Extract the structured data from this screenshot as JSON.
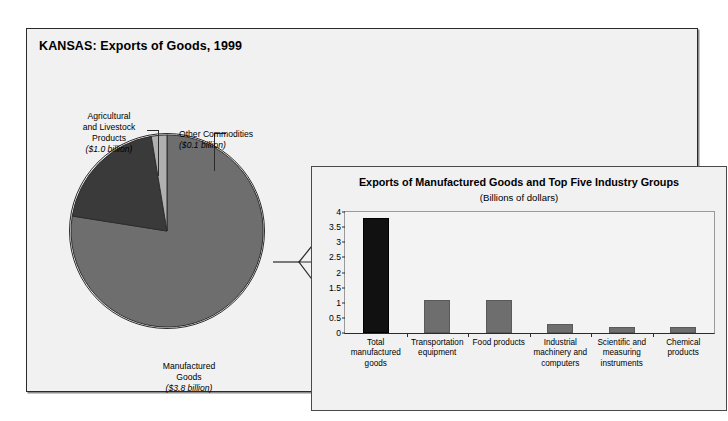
{
  "figure": {
    "title": "KANSAS: Exports of Goods, 1999"
  },
  "pie": {
    "slices": [
      {
        "name": "Manufactured Goods",
        "label_line1": "Manufactured",
        "label_line2": "Goods",
        "amount": "($3.8 billion)",
        "value": 3.8,
        "color": "#6e6e6e"
      },
      {
        "name": "Agricultural and Livestock Products",
        "label_line1": "Agricultural",
        "label_line2": "and Livestock",
        "label_line3": "Products",
        "amount": "($1.0 billion)",
        "value": 1.0,
        "color": "#3a3a3a"
      },
      {
        "name": "Other Commodities",
        "label_line1": "Other Commodities",
        "amount": "($0.1 billion)",
        "value": 0.1,
        "color": "#b0b0b0"
      }
    ]
  },
  "chart_data": {
    "type": "bar",
    "title": "Exports of Manufactured Goods and Top Five Industry Groups",
    "subtitle": "(Billions of dollars)",
    "xlabel": "",
    "ylabel": "",
    "ylim": [
      0,
      4
    ],
    "yticks": [
      "0",
      "0.5",
      "1",
      "1.5",
      "2",
      "2.5",
      "3",
      "3.5",
      "4"
    ],
    "ytick_values": [
      0,
      0.5,
      1,
      1.5,
      2,
      2.5,
      3,
      3.5,
      4
    ],
    "grid": false,
    "legend": "none",
    "categories": [
      "Total manufactured goods",
      "Transportation equipment",
      "Food products",
      "Industrial machinery and computers",
      "Scientific and measuring instruments",
      "Chemical products"
    ],
    "category_lines": [
      [
        "Total",
        "manufactured",
        "goods"
      ],
      [
        "Transportation",
        "equipment"
      ],
      [
        "Food products"
      ],
      [
        "Industrial",
        "machinery and",
        "computers"
      ],
      [
        "Scientific and",
        "measuring",
        "instruments"
      ],
      [
        "Chemical",
        "products"
      ]
    ],
    "values": [
      3.8,
      1.1,
      1.1,
      0.3,
      0.2,
      0.2
    ],
    "bar_colors": [
      "#111111",
      "#6e6e6e",
      "#6e6e6e",
      "#6e6e6e",
      "#6e6e6e",
      "#6e6e6e"
    ]
  }
}
